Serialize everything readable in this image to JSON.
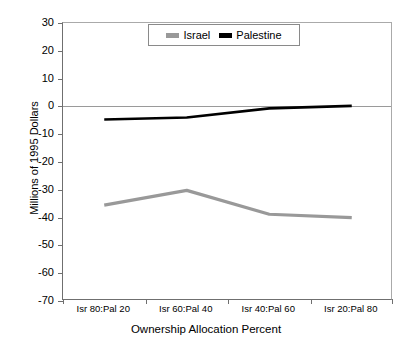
{
  "chart_data": {
    "type": "line",
    "title": "",
    "xlabel": "Ownership Allocation Percent",
    "ylabel": "Millions of 1995 Dollars",
    "categories": [
      "Isr 80:Pal 20",
      "Isr 60:Pal 40",
      "Isr 40:Pal 60",
      "Isr 20:Pal 80"
    ],
    "ylim": [
      -70,
      30
    ],
    "yticks": [
      30,
      20,
      10,
      0,
      -10,
      -20,
      -30,
      -40,
      -50,
      -60,
      -70
    ],
    "ytick_labels": [
      "30",
      "20",
      "10",
      "0",
      "-10",
      "-20",
      "-30",
      "-40",
      "-50",
      "-60",
      "-70"
    ],
    "grid": false,
    "legend_position": "top-center",
    "series": [
      {
        "name": "Israel",
        "color": "#999999",
        "values": [
          -35.5,
          -30.2,
          -38.8,
          -40.0
        ]
      },
      {
        "name": "Palestine",
        "color": "#000000",
        "values": [
          -4.7,
          -4.0,
          -0.7,
          0.2
        ]
      }
    ]
  },
  "legend": {
    "items": [
      {
        "label": "Israel",
        "color": "#999999"
      },
      {
        "label": "Palestine",
        "color": "#000000"
      }
    ]
  },
  "axes": {
    "y_title": "Millions of 1995 Dollars",
    "x_title": "Ownership Allocation Percent"
  }
}
